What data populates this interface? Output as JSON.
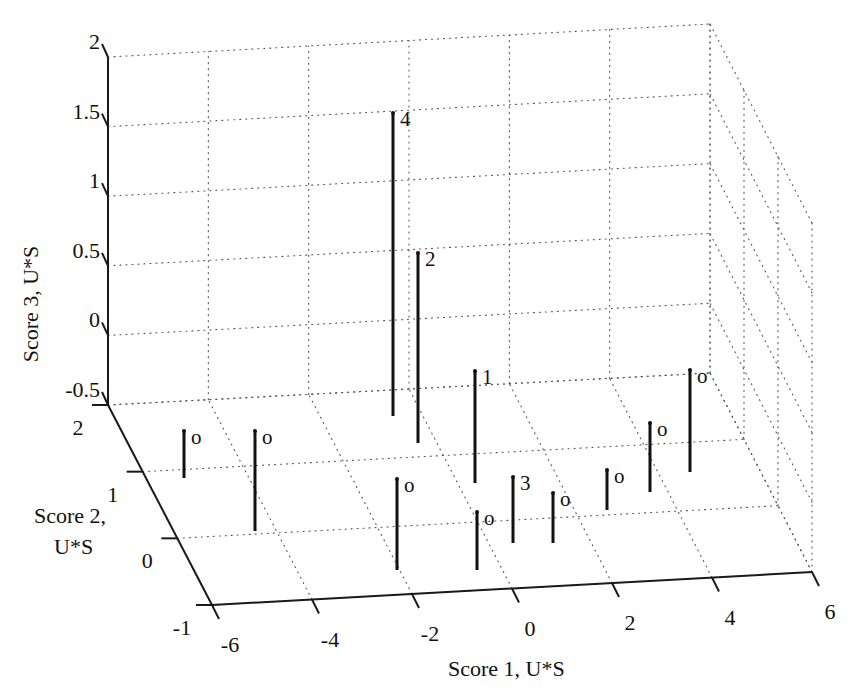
{
  "chart_data": {
    "type": "stem3",
    "title": "",
    "xlabel": "Score 1, U*S",
    "ylabel": "Score 2, U*S",
    "zlabel": "Score 3, U*S",
    "xlim": [
      -6,
      6
    ],
    "ylim": [
      -1,
      2
    ],
    "zlim": [
      -0.5,
      2
    ],
    "x_ticks": [
      "-6",
      "-4",
      "-2",
      "0",
      "2",
      "4",
      "6"
    ],
    "y_ticks": [
      "-1",
      "0",
      "1",
      "2"
    ],
    "z_ticks": [
      "-0.5",
      "0",
      "0.5",
      "1",
      "1.5",
      "2"
    ],
    "grid": true,
    "legend": null,
    "points": [
      {
        "label": "o",
        "x": -5.2,
        "y": 1.2,
        "z": 0.35
      },
      {
        "label": "o",
        "x": -4.1,
        "y": 0.5,
        "z": 0.72
      },
      {
        "label": "4",
        "x": -1.3,
        "y": 0.6,
        "z": 2.2
      },
      {
        "label": "2",
        "x": -1.0,
        "y": 0.3,
        "z": 1.4
      },
      {
        "label": "1",
        "x": 0.0,
        "y": 0.4,
        "z": 0.8
      },
      {
        "label": "o",
        "x": -1.9,
        "y": -0.5,
        "z": 0.65
      },
      {
        "label": "o",
        "x": -0.2,
        "y": -0.5,
        "z": 0.42
      },
      {
        "label": "3",
        "x": 0.5,
        "y": -0.2,
        "z": 0.48
      },
      {
        "label": "o",
        "x": 1.3,
        "y": -0.1,
        "z": 0.36
      },
      {
        "label": "o",
        "x": 2.6,
        "y": 0.3,
        "z": 0.29
      },
      {
        "label": "o",
        "x": 3.8,
        "y": 0.7,
        "z": 0.5
      },
      {
        "label": "o",
        "x": 4.7,
        "y": 1.2,
        "z": 0.74
      }
    ],
    "stems_px": [
      {
        "label": "o",
        "px": 184,
        "top": 431,
        "bottom": 478
      },
      {
        "label": "o",
        "px": 255,
        "top": 431,
        "bottom": 531
      },
      {
        "label": "4",
        "px": 393,
        "top": 113,
        "bottom": 416
      },
      {
        "label": "2",
        "px": 418,
        "top": 253,
        "bottom": 443
      },
      {
        "label": "1",
        "px": 475,
        "top": 371,
        "bottom": 483
      },
      {
        "label": "o",
        "px": 397,
        "top": 479,
        "bottom": 570
      },
      {
        "label": "o",
        "px": 477,
        "top": 512,
        "bottom": 570
      },
      {
        "label": "3",
        "px": 513,
        "top": 477,
        "bottom": 543
      },
      {
        "label": "o",
        "px": 553,
        "top": 493,
        "bottom": 543
      },
      {
        "label": "o",
        "px": 607,
        "top": 470,
        "bottom": 510
      },
      {
        "label": "o",
        "px": 650,
        "top": 423,
        "bottom": 492
      },
      {
        "label": "o",
        "px": 690,
        "top": 370,
        "bottom": 472
      }
    ]
  },
  "colors": {
    "axis": "#1a1a1a",
    "grid": "#555555",
    "stem": "#111111",
    "background": "#ffffff"
  }
}
